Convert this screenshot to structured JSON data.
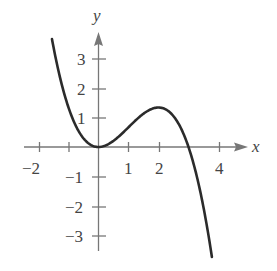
{
  "chart_data": {
    "type": "line",
    "title": "",
    "function": "f(x) = x^2 - x^3/3",
    "xlabel": "x",
    "ylabel": "y",
    "xlim": [
      -2.3,
      4.9
    ],
    "ylim": [
      -3.6,
      4.0
    ],
    "x_ticks": [
      -2,
      -1,
      1,
      2,
      3,
      4
    ],
    "x_tick_labels": [
      "−2",
      "",
      "1",
      "2",
      "",
      "4"
    ],
    "y_ticks": [
      -3,
      -2,
      -1,
      1,
      2,
      3
    ],
    "y_tick_labels": [
      "−3",
      "−2",
      "−1",
      "1",
      "2",
      "3"
    ],
    "grid": false,
    "series": [
      {
        "name": "curve",
        "x": [
          -1.55,
          -1.0,
          -0.5,
          0,
          0.5,
          1.0,
          1.5,
          2.0,
          2.5,
          3.0,
          3.5,
          3.78
        ],
        "values": [
          3.64,
          1.33,
          0.29,
          0,
          0.21,
          0.67,
          1.13,
          1.33,
          1.04,
          0,
          -2.04,
          -3.71
        ]
      }
    ],
    "key_points": {
      "local_min": [
        0,
        0
      ],
      "local_max": [
        2,
        1.33
      ],
      "x_intercepts": [
        0,
        3
      ]
    }
  },
  "axes": {
    "x_label": "x",
    "y_label": "y",
    "x_tick_labels": {
      "neg2": "−2",
      "one": "1",
      "two": "2",
      "four": "4"
    },
    "y_tick_labels": {
      "three": "3",
      "two": "2",
      "one": "1",
      "neg1": "−1",
      "neg2": "−2",
      "neg3": "−3"
    }
  }
}
